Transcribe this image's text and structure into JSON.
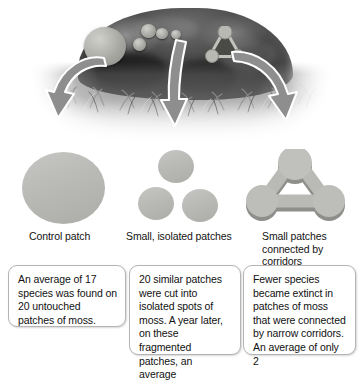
{
  "figure": {
    "type": "scientific-illustration"
  },
  "photo": {
    "alt": "grayscale photograph of a moss-covered boulder surrounded by grass",
    "patch_markings": [
      {
        "name": "control-patch-marking",
        "shape": "large circle"
      },
      {
        "name": "isolated-patches-marking",
        "shape": "small scattered circles"
      },
      {
        "name": "corridor-patches-marking",
        "shape": "triangle of circles joined by bars"
      }
    ]
  },
  "arrows": [
    {
      "name": "arrow-to-control",
      "direction": "curve-down-left"
    },
    {
      "name": "arrow-to-isolated",
      "direction": "down"
    },
    {
      "name": "arrow-to-corridor",
      "direction": "curve-down-right"
    }
  ],
  "diagrams": [
    {
      "id": "control",
      "caption": "Control patch",
      "shape": "single large disc",
      "patch_count": 1
    },
    {
      "id": "isolated",
      "caption": "Small, isolated patches",
      "shape": "three separate small discs",
      "patch_count": 3
    },
    {
      "id": "corridor",
      "caption": "Small patches connected by corridors",
      "shape": "three small discs joined by narrow bars",
      "patch_count": 3
    }
  ],
  "textboxes": [
    {
      "id": "textbox-control",
      "text": "An average of 17 species was found on 20 untouched patches of moss."
    },
    {
      "id": "textbox-isolated",
      "text": "20 similar patches were cut into isolated spots of moss. A year later, on these fragmented patches, an average"
    },
    {
      "id": "textbox-corridor",
      "text": "Fewer species became extinct in patches of moss that were connected by narrow corridors. An average of only 2"
    }
  ],
  "colors": {
    "patch_fill": "#b9b9b6",
    "patch_shadow": "#8e8e8b",
    "arrow_fill": "#8e8e8e",
    "arrow_outline": "#ffffff",
    "text": "#111111",
    "box_border": "#b4b4b4",
    "background": "#ffffff"
  }
}
